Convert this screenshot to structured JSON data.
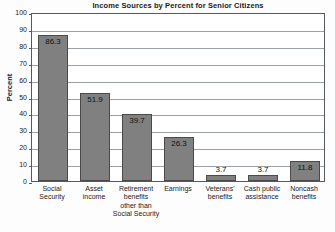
{
  "chart_data": {
    "type": "bar",
    "title": "Income Sources by Percent for Senior Citizens",
    "xlabel": "",
    "ylabel": "Percent",
    "ylim": [
      0,
      100
    ],
    "yticks": [
      0,
      10,
      20,
      30,
      40,
      50,
      60,
      70,
      80,
      90,
      100
    ],
    "grid": true,
    "legend": "none",
    "categories": [
      "Social Security",
      "Asset income",
      "Retirement benefits other than Social Security",
      "Earnings",
      "Veterans' benefits",
      "Cash public assistance",
      "Noncash benefits"
    ],
    "category_lines": [
      [
        "Social",
        "Security"
      ],
      [
        "Asset",
        "income"
      ],
      [
        "Retirement",
        "benefits",
        "other than",
        "Social Security"
      ],
      [
        "Earnings"
      ],
      [
        "Veterans'",
        "benefits"
      ],
      [
        "Cash public",
        "assistance"
      ],
      [
        "Noncash",
        "benefits"
      ]
    ],
    "values": [
      86.3,
      51.9,
      39.7,
      26.3,
      3.7,
      3.7,
      11.8
    ],
    "value_labels": [
      "86.3",
      "51.9",
      "39.7",
      "26.3",
      "3.7",
      "3.7",
      "11.8"
    ],
    "bar_color": "#808080",
    "bar_border_color": "#4a4a4a",
    "grid_color": "#9aa0a4",
    "axis_color": "#555a5e",
    "background_color": "#ffffff"
  }
}
